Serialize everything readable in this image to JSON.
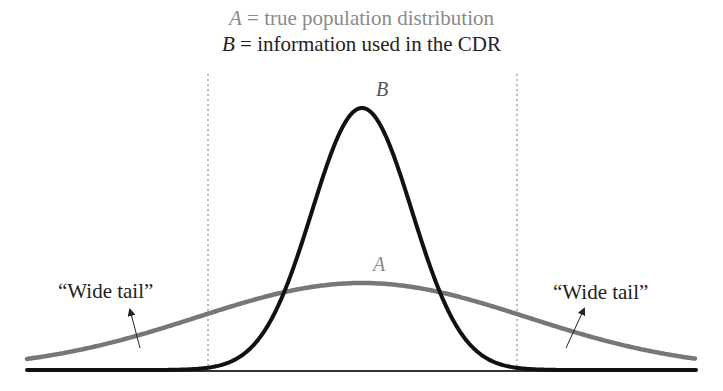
{
  "legend": {
    "a": {
      "symbol": "A",
      "separator": " = ",
      "text": "true population distribution",
      "color": "#8a8a8a"
    },
    "b": {
      "symbol": "B",
      "separator": " = ",
      "text": "information used in the CDR",
      "color": "#222222"
    }
  },
  "curves": {
    "a": {
      "label": "A",
      "description": "wide distribution",
      "color": "#777777"
    },
    "b": {
      "label": "B",
      "description": "narrow peaked distribution",
      "color": "#111111"
    }
  },
  "annotations": {
    "left_tail": "“Wide tail”",
    "right_tail": "“Wide tail”"
  },
  "chart_data": {
    "type": "line",
    "title": "",
    "series": [
      {
        "name": "A = true population distribution",
        "shape": "normal",
        "mean_px": 362,
        "peak_px_y": 283,
        "relative_height": 0.33,
        "relative_spread": "wide"
      },
      {
        "name": "B = information used in the CDR",
        "shape": "normal",
        "mean_px": 362,
        "peak_px_y": 108,
        "relative_height": 1.0,
        "relative_spread": "narrow"
      }
    ],
    "cutoffs": {
      "left_dashed_x_px": 208,
      "right_dashed_x_px": 517
    },
    "annotations": [
      "“Wide tail” (left)",
      "“Wide tail” (right)"
    ],
    "xlabel": "",
    "ylabel": "",
    "grid": false
  }
}
